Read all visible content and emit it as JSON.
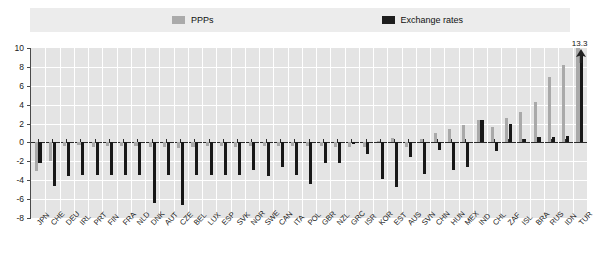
{
  "legend": {
    "items": [
      {
        "label": "PPPs",
        "color": "#a9a9a9",
        "icon": "square-swatch-icon"
      },
      {
        "label": "Exchange rates",
        "color": "#181818",
        "icon": "square-swatch-icon"
      }
    ]
  },
  "annotation": {
    "value_label": "13.3",
    "icon": "up-arrow-icon"
  },
  "chart_data": {
    "type": "bar",
    "title": "",
    "subtitle": "",
    "xlabel": "",
    "ylabel": "",
    "ylim": [
      -8,
      10
    ],
    "yticks": [
      -8,
      -6,
      -4,
      -2,
      0,
      2,
      4,
      6,
      8,
      10
    ],
    "ytick_labels": [
      "-8",
      "-6",
      "-4",
      "-2",
      "0",
      "2",
      "4",
      "6",
      "8",
      "10"
    ],
    "grid": true,
    "legend_position": "top",
    "categories": [
      "JPN",
      "CHE",
      "DEU",
      "IRL",
      "PRT",
      "FIN",
      "FRA",
      "NLD",
      "DNK",
      "AUT",
      "CZE",
      "BEL",
      "LUX",
      "ESP",
      "SVK",
      "NOR",
      "SWE",
      "CAN",
      "ITA",
      "POL",
      "GBR",
      "NZL",
      "GRC",
      "ISR",
      "KOR",
      "EST",
      "AUS",
      "SVN",
      "CHN",
      "HUN",
      "MEX",
      "IND",
      "CHL",
      "ZAF",
      "ISL",
      "BRA",
      "RUS",
      "IDN",
      "TUR"
    ],
    "series": [
      {
        "name": "PPPs",
        "color": "#a9a9a9",
        "values": [
          -3.0,
          -2.0,
          -0.4,
          -0.3,
          -0.5,
          -0.4,
          -0.4,
          -0.4,
          -0.5,
          -0.5,
          -0.6,
          -0.5,
          -0.4,
          -0.4,
          -0.5,
          -0.4,
          -0.4,
          -0.4,
          -0.4,
          -0.4,
          -0.4,
          -0.5,
          -0.5,
          -0.5,
          0.2,
          0.5,
          -0.5,
          0.4,
          1.0,
          1.4,
          1.9,
          2.4,
          1.6,
          2.6,
          3.2,
          4.3,
          6.9,
          8.2,
          13.3
        ]
      },
      {
        "name": "Exchange rates",
        "color": "#181818",
        "values": [
          -2.2,
          -4.6,
          -3.6,
          -3.4,
          -3.5,
          -3.4,
          -3.5,
          -3.5,
          -6.4,
          -3.5,
          -6.6,
          -3.5,
          -3.4,
          -3.4,
          -3.4,
          -2.9,
          -3.6,
          -2.6,
          -3.4,
          -4.4,
          -2.2,
          -2.2,
          -0.2,
          -1.2,
          -3.9,
          -4.7,
          -1.5,
          -3.3,
          -0.8,
          -2.9,
          -2.6,
          2.4,
          -0.9,
          2.0,
          0.4,
          0.6,
          0.6,
          0.7,
          9.3
        ]
      }
    ],
    "annotations": [
      {
        "category": "TUR",
        "series": "PPPs",
        "text": "13.3",
        "note": "bar clipped at axis maximum, arrow marker"
      }
    ]
  }
}
